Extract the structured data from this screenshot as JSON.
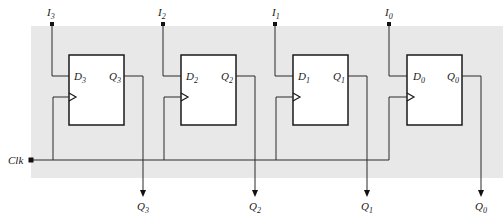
{
  "diagram": {
    "type": "parallel-in parallel-out register",
    "background_color": "#e8e8e8",
    "line_color": "#2a2a2a",
    "clock": {
      "label": "Clk",
      "sub": ""
    },
    "flip_flops": [
      {
        "id": "ff3",
        "input": {
          "label": "I",
          "sub": "3"
        },
        "d": {
          "label": "D",
          "sub": "3"
        },
        "q": {
          "label": "Q",
          "sub": "3"
        },
        "output": {
          "label": "Q",
          "sub": "3"
        }
      },
      {
        "id": "ff2",
        "input": {
          "label": "I",
          "sub": "2"
        },
        "d": {
          "label": "D",
          "sub": "2"
        },
        "q": {
          "label": "Q",
          "sub": "2"
        },
        "output": {
          "label": "Q",
          "sub": "2"
        }
      },
      {
        "id": "ff1",
        "input": {
          "label": "I",
          "sub": "1"
        },
        "d": {
          "label": "D",
          "sub": "1"
        },
        "q": {
          "label": "Q",
          "sub": "1"
        },
        "output": {
          "label": "Q",
          "sub": "1"
        }
      },
      {
        "id": "ff0",
        "input": {
          "label": "I",
          "sub": "0"
        },
        "d": {
          "label": "D",
          "sub": "0"
        },
        "q": {
          "label": "Q",
          "sub": "0"
        },
        "output": {
          "label": "Q",
          "sub": "0"
        }
      }
    ]
  }
}
